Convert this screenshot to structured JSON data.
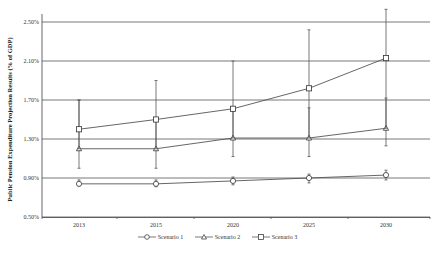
{
  "chart_data": {
    "type": "line",
    "title": "",
    "xlabel": "",
    "ylabel": "Public Pension Expenditure Projection Results (% of GDP)",
    "categories": [
      "2013",
      "2015",
      "2020",
      "2025",
      "2030"
    ],
    "y_ticks": [
      "0.50%",
      "0.90%",
      "1.30%",
      "1.70%",
      "2.10%",
      "2.50%"
    ],
    "ylim": [
      0.5,
      2.5
    ],
    "grid": "horizontal",
    "legend_position": "bottom",
    "series": [
      {
        "name": "Scenario 1",
        "marker": "circle",
        "values": [
          0.84,
          0.84,
          0.87,
          0.9,
          0.93
        ],
        "error_low": [
          0.82,
          0.81,
          0.83,
          0.85,
          0.88
        ],
        "error_high": [
          0.88,
          0.88,
          0.91,
          0.94,
          0.98
        ]
      },
      {
        "name": "Scenario 2",
        "marker": "triangle",
        "values": [
          1.2,
          1.2,
          1.31,
          1.31,
          1.41
        ],
        "error_low": [
          1.0,
          1.0,
          1.12,
          1.12,
          1.23
        ],
        "error_high": [
          1.7,
          1.5,
          1.61,
          1.62,
          1.72
        ]
      },
      {
        "name": "Scenario 3",
        "marker": "square",
        "values": [
          1.4,
          1.5,
          1.61,
          1.82,
          2.13
        ],
        "error_low": [
          1.2,
          1.2,
          1.31,
          1.31,
          1.41
        ],
        "error_high": [
          1.7,
          1.9,
          2.1,
          2.42,
          2.63
        ]
      }
    ]
  },
  "legend": {
    "items": [
      "Scenario 1",
      "Scenario 2",
      "Scenario 3"
    ]
  }
}
